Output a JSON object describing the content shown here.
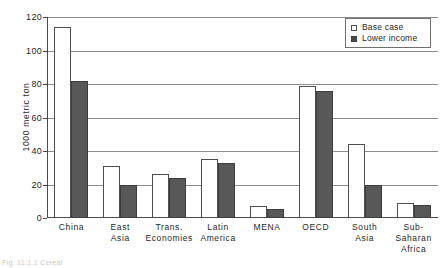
{
  "chart_data": {
    "type": "bar",
    "title": "",
    "xlabel": "",
    "ylabel": "1000 metric ton",
    "ylim": [
      0,
      120
    ],
    "yticks": [
      0,
      20,
      40,
      60,
      80,
      100,
      120
    ],
    "grid": true,
    "legend_position": "top-right",
    "categories": [
      "China",
      "East Asia",
      "Trans. Economies",
      "Latin America",
      "MENA",
      "OECD",
      "South Asia",
      "Sub-Saharan Africa"
    ],
    "category_lines": [
      [
        "China"
      ],
      [
        "East",
        "Asia"
      ],
      [
        "Trans.",
        "Economies"
      ],
      [
        "Latin",
        "America"
      ],
      [
        "MENA"
      ],
      [
        "OECD"
      ],
      [
        "South",
        "Asia"
      ],
      [
        "Sub-Saharan",
        "Africa"
      ]
    ],
    "series": [
      {
        "name": "Base case",
        "color": "#ffffff",
        "values": [
          114,
          31,
          26,
          35.5,
          7,
          79,
          44,
          9
        ]
      },
      {
        "name": "Lower income",
        "color": "#585858",
        "values": [
          82,
          19.5,
          24,
          33,
          5.5,
          76,
          19.5,
          7.5
        ]
      }
    ]
  },
  "legend": {
    "items": [
      {
        "label": "Base case",
        "style": "base"
      },
      {
        "label": "Lower income",
        "style": "lower"
      }
    ]
  },
  "caption": {
    "text": "Fig. 11.1.1  Cereal"
  }
}
